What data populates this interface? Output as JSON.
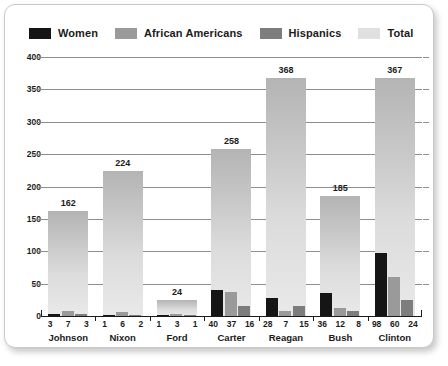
{
  "chart_data": {
    "type": "bar",
    "title": "",
    "subtitle": "",
    "xlabel": "",
    "ylabel": "",
    "ylim": [
      0,
      400
    ],
    "ytick_step": 50,
    "yticks": [
      "0",
      "50",
      "100",
      "150",
      "200",
      "250",
      "300",
      "350",
      "400"
    ],
    "grid": true,
    "legend_position": "top-left",
    "grouping": "overlaid-with-total-backdrop",
    "categories": [
      "Johnson",
      "Nixon",
      "Ford",
      "Carter",
      "Reagan",
      "Bush",
      "Clinton"
    ],
    "series": [
      {
        "name": "Women",
        "color": "#151515",
        "values": [
          3,
          1,
          1,
          40,
          28,
          36,
          98
        ]
      },
      {
        "name": "African Americans",
        "color": "#9a9a9a",
        "values": [
          7,
          6,
          3,
          37,
          7,
          12,
          60
        ]
      },
      {
        "name": "Hispanics",
        "color": "#7d7d7d",
        "values": [
          3,
          2,
          1,
          16,
          15,
          8,
          24
        ]
      },
      {
        "name": "Total",
        "color": "#dcdcdc",
        "values": [
          162,
          224,
          24,
          258,
          368,
          185,
          367
        ]
      }
    ],
    "total_labels": [
      "162",
      "224",
      "24",
      "258",
      "368",
      "185",
      "367"
    ],
    "value_labels": [
      [
        "3",
        "7",
        "3"
      ],
      [
        "1",
        "6",
        "2"
      ],
      [
        "1",
        "3",
        "1"
      ],
      [
        "40",
        "37",
        "16"
      ],
      [
        "28",
        "7",
        "15"
      ],
      [
        "36",
        "12",
        "8"
      ],
      [
        "98",
        "60",
        "24"
      ]
    ]
  },
  "legend": {
    "items": [
      {
        "label": "Women",
        "color": "#151515"
      },
      {
        "label": "African Americans",
        "color": "#9a9a9a"
      },
      {
        "label": "Hispanics",
        "color": "#7d7d7d"
      },
      {
        "label": "Total",
        "color": "#e0e0e0"
      }
    ]
  }
}
